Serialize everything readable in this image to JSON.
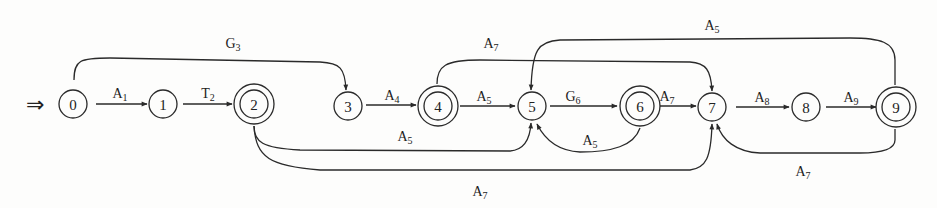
{
  "diagram": {
    "type": "finite-automaton",
    "start_marker": "⇒",
    "start_state": "0",
    "nodes": [
      {
        "id": "0",
        "label": "0",
        "x": 73,
        "y": 104,
        "accepting": false
      },
      {
        "id": "1",
        "label": "1",
        "x": 163,
        "y": 104,
        "accepting": false
      },
      {
        "id": "2",
        "label": "2",
        "x": 254,
        "y": 104,
        "accepting": true
      },
      {
        "id": "3",
        "label": "3",
        "x": 348,
        "y": 106,
        "accepting": false
      },
      {
        "id": "4",
        "label": "4",
        "x": 438,
        "y": 106,
        "accepting": true
      },
      {
        "id": "5",
        "label": "5",
        "x": 532,
        "y": 106,
        "accepting": false
      },
      {
        "id": "6",
        "label": "6",
        "x": 640,
        "y": 106,
        "accepting": true
      },
      {
        "id": "7",
        "label": "7",
        "x": 712,
        "y": 107,
        "accepting": false
      },
      {
        "id": "8",
        "label": "8",
        "x": 806,
        "y": 107,
        "accepting": false
      },
      {
        "id": "9",
        "label": "9",
        "x": 896,
        "y": 107,
        "accepting": true
      }
    ],
    "edges": [
      {
        "from": "0",
        "to": "1",
        "label": "A",
        "sub": "1"
      },
      {
        "from": "1",
        "to": "2",
        "label": "T",
        "sub": "2"
      },
      {
        "from": "0",
        "to": "3",
        "label": "G",
        "sub": "3"
      },
      {
        "from": "3",
        "to": "4",
        "label": "A",
        "sub": "4"
      },
      {
        "from": "4",
        "to": "5",
        "label": "A",
        "sub": "5"
      },
      {
        "from": "4",
        "to": "7",
        "label": "A",
        "sub": "7"
      },
      {
        "from": "5",
        "to": "6",
        "label": "G",
        "sub": "6"
      },
      {
        "from": "6",
        "to": "5",
        "label": "A",
        "sub": "5"
      },
      {
        "from": "2",
        "to": "5",
        "label": "A",
        "sub": "5"
      },
      {
        "from": "2",
        "to": "7",
        "label": "A",
        "sub": "7"
      },
      {
        "from": "6",
        "to": "7",
        "label": "A",
        "sub": "7"
      },
      {
        "from": "7",
        "to": "8",
        "label": "A",
        "sub": "8"
      },
      {
        "from": "8",
        "to": "9",
        "label": "A",
        "sub": "9"
      },
      {
        "from": "9",
        "to": "5",
        "label": "A",
        "sub": "5"
      },
      {
        "from": "9",
        "to": "7",
        "label": "A",
        "sub": "7"
      }
    ]
  },
  "labels": {
    "e01": {
      "main": "A",
      "sub": "1"
    },
    "e12": {
      "main": "T",
      "sub": "2"
    },
    "e03": {
      "main": "G",
      "sub": "3"
    },
    "e34": {
      "main": "A",
      "sub": "4"
    },
    "e45": {
      "main": "A",
      "sub": "5"
    },
    "e47": {
      "main": "A",
      "sub": "7"
    },
    "e56": {
      "main": "G",
      "sub": "6"
    },
    "e65": {
      "main": "A",
      "sub": "5"
    },
    "e25": {
      "main": "A",
      "sub": "5"
    },
    "e27": {
      "main": "A",
      "sub": "7"
    },
    "e67": {
      "main": "A",
      "sub": "7"
    },
    "e78": {
      "main": "A",
      "sub": "8"
    },
    "e89": {
      "main": "A",
      "sub": "9"
    },
    "e95": {
      "main": "A",
      "sub": "5"
    },
    "e97": {
      "main": "A",
      "sub": "7"
    }
  },
  "node_labels": {
    "n0": "0",
    "n1": "1",
    "n2": "2",
    "n3": "3",
    "n4": "4",
    "n5": "5",
    "n6": "6",
    "n7": "7",
    "n8": "8",
    "n9": "9"
  },
  "start_marker": "⇒"
}
